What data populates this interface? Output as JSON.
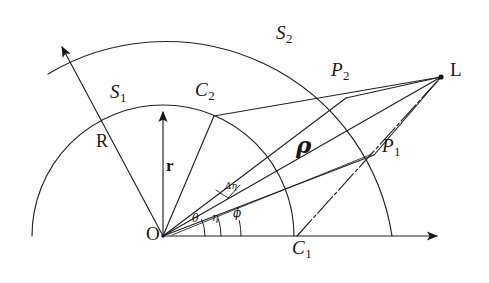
{
  "figure": {
    "background_color": "#ffffff",
    "stroke_color": "#1a1a1a",
    "width": 489,
    "height": 283,
    "origin": {
      "label": "O",
      "x": 163,
      "y": 236
    }
  },
  "labels": {
    "origin": "O",
    "light_source": "L",
    "rho": "ρ",
    "radius_outer": "R",
    "radius_inner": "r",
    "arc_inner": "S",
    "arc_inner_sub": "1",
    "arc_outer": "S",
    "arc_outer_sub": "2",
    "point_p1": "P",
    "point_p1_sub": "1",
    "point_p2": "P",
    "point_p2_sub": "2",
    "point_c1": "C",
    "point_c1_sub": "1",
    "point_c2": "C",
    "point_c2_sub": "2",
    "angle_theta": "θ",
    "angle_eta": "η",
    "angle_phi": "ϕ",
    "delta_eta": "Δη"
  },
  "label_positions": {
    "origin": {
      "x": 146,
      "y": 224
    },
    "light_source": {
      "x": 450,
      "y": 60
    },
    "rho": {
      "x": 296,
      "y": 133
    },
    "radius_outer": {
      "x": 96,
      "y": 132
    },
    "radius_inner": {
      "x": 166,
      "y": 157
    },
    "arc_inner": {
      "x": 110,
      "y": 82
    },
    "arc_outer": {
      "x": 276,
      "y": 23
    },
    "point_p1": {
      "x": 382,
      "y": 136
    },
    "point_p2": {
      "x": 331,
      "y": 60
    },
    "point_c1": {
      "x": 292,
      "y": 238
    },
    "point_c2": {
      "x": 195,
      "y": 80
    },
    "angle_theta": {
      "x": 192,
      "y": 213
    },
    "angle_eta": {
      "x": 212,
      "y": 212
    },
    "angle_phi": {
      "x": 233,
      "y": 208
    },
    "delta_eta": {
      "x": 226,
      "y": 184
    }
  },
  "geometry": {
    "arcs": [
      {
        "name": "inner-arc-S1",
        "cx": 163,
        "cy": 236,
        "r": 131,
        "start_deg": 0,
        "end_deg": 180
      },
      {
        "name": "outer-arc-S2",
        "cx": 163,
        "cy": 236,
        "r": 229,
        "start_deg": 0,
        "end_deg": 157
      }
    ],
    "rays": [
      {
        "name": "axis-horizontal",
        "x1": 163,
        "y1": 236,
        "x2": 443,
        "y2": 236,
        "arrow": true
      },
      {
        "name": "radius-r-vertical",
        "x1": 163,
        "y1": 236,
        "x2": 163,
        "y2": 108,
        "arrow": true
      },
      {
        "name": "radius-R-diagonal",
        "x1": 163,
        "y1": 236,
        "x2": 59,
        "y2": 42,
        "arrow": true
      },
      {
        "name": "ray-to-C2",
        "x1": 163,
        "y1": 236,
        "x2": 214,
        "y2": 116
      },
      {
        "name": "ray-O-to-P2",
        "x1": 163,
        "y1": 236,
        "x2": 346,
        "y2": 98
      },
      {
        "name": "ray-O-to-L-rho",
        "x1": 163,
        "y1": 236,
        "x2": 441,
        "y2": 77
      },
      {
        "name": "ray-O-to-P1",
        "x1": 163,
        "y1": 236,
        "x2": 374,
        "y2": 155
      },
      {
        "name": "chord-C2-to-L",
        "x1": 214,
        "y1": 116,
        "x2": 441,
        "y2": 77
      },
      {
        "name": "chord-P2-to-L",
        "x1": 346,
        "y1": 98,
        "x2": 441,
        "y2": 77
      },
      {
        "name": "chord-C1-to-L",
        "x1": 297,
        "y1": 236,
        "x2": 441,
        "y2": 77
      },
      {
        "name": "chord-P1-to-L",
        "x1": 374,
        "y1": 155,
        "x2": 441,
        "y2": 77
      }
    ],
    "points": [
      {
        "name": "point-L",
        "x": 441,
        "y": 77
      },
      {
        "name": "point-P1",
        "x": 374,
        "y": 155
      },
      {
        "name": "point-P2",
        "x": 346,
        "y": 98
      },
      {
        "name": "point-C1",
        "x": 297,
        "y": 236
      },
      {
        "name": "point-C2",
        "x": 214,
        "y": 116
      },
      {
        "name": "point-O",
        "x": 163,
        "y": 236
      }
    ],
    "angle_arcs": [
      {
        "name": "angle-arc-theta",
        "cx": 163,
        "cy": 236,
        "r": 42,
        "from_deg": 0,
        "to_deg": 23
      },
      {
        "name": "angle-arc-eta",
        "cx": 163,
        "cy": 236,
        "r": 58,
        "from_deg": 0,
        "to_deg": 17
      },
      {
        "name": "angle-arc-phi",
        "cx": 163,
        "cy": 236,
        "r": 78,
        "from_deg": 0,
        "to_deg": 11
      }
    ]
  }
}
